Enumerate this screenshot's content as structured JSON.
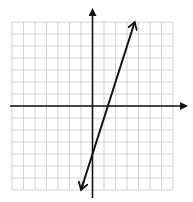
{
  "chart_data": {
    "type": "line",
    "title": "",
    "xlabel": "",
    "ylabel": "",
    "xlim": [
      -7,
      7
    ],
    "ylim": [
      -7,
      7
    ],
    "grid": true,
    "grid_step": 1,
    "axes_arrows": true,
    "series": [
      {
        "name": "y = 3x - 4",
        "equation": "y = 3x - 4",
        "slope": 3,
        "intercept": -4,
        "x": [
          -1,
          3.67
        ],
        "y": [
          -7,
          7
        ],
        "arrows_both_ends": true
      }
    ],
    "colors": {
      "grid": "#c8c8c8",
      "axis": "#111111",
      "line": "#111111"
    }
  }
}
